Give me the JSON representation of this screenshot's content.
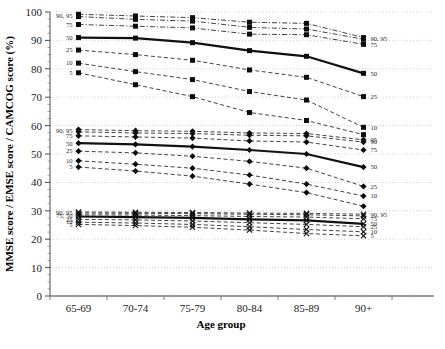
{
  "chart_data": {
    "type": "line",
    "title": "",
    "xlabel": "Age group",
    "ylabel": "MMSE score / EMSE score / CAMCOG score (%)",
    "categories": [
      "65-69",
      "70-74",
      "75-79",
      "80-84",
      "85-89",
      "90+"
    ],
    "ylim": [
      0,
      100
    ],
    "ytick_values": [
      0,
      10,
      20,
      30,
      40,
      50,
      60,
      70,
      80,
      90,
      100
    ],
    "ytick_labels": [
      "0",
      "10",
      "20",
      "30",
      "40",
      "50",
      "60",
      "70",
      "80",
      "90",
      "100"
    ],
    "grid": true,
    "legend_position": "inline-end-labels",
    "line_color": "#111111",
    "groups": [
      {
        "name": "CAMCOG score",
        "marker": "square",
        "left_labels": [
          "90, 95",
          "75",
          "50",
          "25",
          "10",
          "5"
        ],
        "right_labels": [
          "90, 95",
          "75",
          "50",
          "25",
          "10"
        ],
        "series": [
          {
            "name": "95",
            "percentile": 95,
            "style": "dash-dot",
            "width": 0.8,
            "values": [
              99.2,
              98.6,
              98.0,
              96.4,
              96.0,
              91.0
            ]
          },
          {
            "name": "90",
            "percentile": 90,
            "style": "dash-dot",
            "width": 0.8,
            "values": [
              98.4,
              97.4,
              96.8,
              94.6,
              94.0,
              90.4
            ]
          },
          {
            "name": "75",
            "percentile": 75,
            "style": "dash-dot",
            "width": 0.8,
            "values": [
              95.6,
              95.0,
              94.4,
              92.2,
              92.0,
              88.6
            ]
          },
          {
            "name": "50",
            "percentile": 50,
            "style": "solid",
            "width": 2.2,
            "values": [
              91.0,
              90.8,
              89.2,
              86.4,
              84.4,
              78.4
            ]
          },
          {
            "name": "25",
            "percentile": 25,
            "style": "dashed",
            "width": 0.8,
            "values": [
              86.6,
              85.0,
              83.0,
              79.6,
              77.0,
              70.2
            ]
          },
          {
            "name": "10",
            "percentile": 10,
            "style": "dashed",
            "width": 0.8,
            "values": [
              82.0,
              79.0,
              76.2,
              72.0,
              69.0,
              59.4
            ]
          },
          {
            "name": "5",
            "percentile": 5,
            "style": "dashed",
            "width": 0.8,
            "values": [
              78.6,
              74.4,
              70.2,
              64.6,
              61.8,
              56.8
            ]
          }
        ]
      },
      {
        "name": "EMSE score",
        "marker": "diamond",
        "left_labels": [
          "90, 95",
          "75",
          "50",
          "25",
          "10",
          "5"
        ],
        "right_labels": [
          "95",
          "90",
          "75",
          "50",
          "25",
          "10"
        ],
        "series": [
          {
            "name": "95",
            "percentile": 95,
            "style": "dashed",
            "width": 0.8,
            "values": [
              58.6,
              58.2,
              58.0,
              57.4,
              57.2,
              55.0
            ]
          },
          {
            "name": "90",
            "percentile": 90,
            "style": "dashed",
            "width": 0.8,
            "values": [
              57.8,
              57.4,
              57.2,
              56.6,
              56.4,
              54.2
            ]
          },
          {
            "name": "75",
            "percentile": 75,
            "style": "dashed",
            "width": 0.8,
            "values": [
              56.4,
              56.0,
              55.6,
              54.6,
              54.2,
              51.4
            ]
          },
          {
            "name": "50",
            "percentile": 50,
            "style": "solid",
            "width": 2.2,
            "values": [
              53.8,
              53.4,
              52.6,
              51.4,
              50.0,
              45.4
            ]
          },
          {
            "name": "25",
            "percentile": 25,
            "style": "dashed",
            "width": 0.8,
            "values": [
              51.0,
              50.4,
              49.2,
              47.4,
              45.0,
              38.6
            ]
          },
          {
            "name": "10",
            "percentile": 10,
            "style": "dashed",
            "width": 0.8,
            "values": [
              47.6,
              46.4,
              45.0,
              42.6,
              39.4,
              35.2
            ]
          },
          {
            "name": "5",
            "percentile": 5,
            "style": "dashed",
            "width": 0.8,
            "values": [
              45.4,
              44.0,
              42.2,
              39.4,
              36.4,
              31.6
            ]
          }
        ]
      },
      {
        "name": "MMSE score",
        "marker": "cross",
        "left_labels": [
          "90, 95",
          "75, 50",
          "25",
          "10",
          "5"
        ],
        "right_labels": [
          "90, 95",
          "75",
          "50",
          "25",
          "10",
          "5"
        ],
        "series": [
          {
            "name": "95",
            "percentile": 95,
            "style": "dashed",
            "width": 0.8,
            "values": [
              29.6,
              29.5,
              29.4,
              29.2,
              29.1,
              28.8
            ]
          },
          {
            "name": "90",
            "percentile": 90,
            "style": "dashed",
            "width": 0.8,
            "values": [
              29.2,
              29.1,
              29.0,
              28.8,
              28.6,
              28.2
            ]
          },
          {
            "name": "75",
            "percentile": 75,
            "style": "dashed",
            "width": 0.8,
            "values": [
              28.6,
              28.5,
              28.3,
              28.0,
              27.8,
              27.2
            ]
          },
          {
            "name": "50",
            "percentile": 50,
            "style": "solid",
            "width": 2.2,
            "values": [
              28.0,
              27.8,
              27.5,
              27.0,
              26.6,
              25.4
            ]
          },
          {
            "name": "25",
            "percentile": 25,
            "style": "dashed",
            "width": 0.8,
            "values": [
              27.0,
              26.8,
              26.4,
              25.8,
              25.2,
              24.4
            ]
          },
          {
            "name": "10",
            "percentile": 10,
            "style": "dashed",
            "width": 0.8,
            "values": [
              26.0,
              25.7,
              25.2,
              24.4,
              23.4,
              22.6
            ]
          },
          {
            "name": "5",
            "percentile": 5,
            "style": "dashed",
            "width": 0.8,
            "values": [
              25.2,
              24.8,
              24.2,
              23.2,
              22.0,
              21.2
            ]
          }
        ]
      }
    ]
  }
}
